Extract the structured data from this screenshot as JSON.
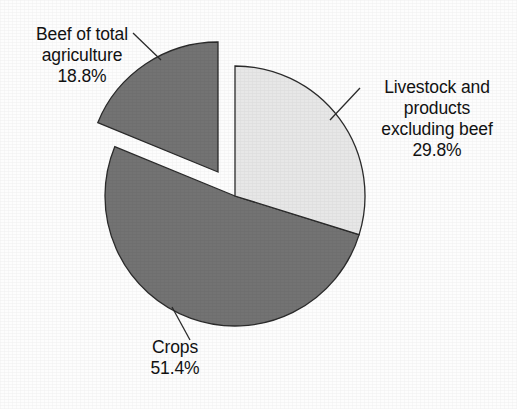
{
  "chart_data": {
    "type": "pie",
    "title": "",
    "categories": [
      "Beef of total agriculture",
      "Livestock and products excluding beef",
      "Crops"
    ],
    "values": [
      18.8,
      29.8,
      51.4
    ],
    "value_labels": [
      "18.8%",
      "29.8%",
      "51.4%"
    ],
    "units": "percent",
    "start_angle_deg": 0,
    "direction": "clockwise",
    "legend": "none",
    "grid": false,
    "slices": [
      {
        "name": "Beef of total agriculture",
        "value": 18.8,
        "label_lines": [
          "Beef of total",
          "agriculture",
          "18.8%"
        ],
        "color": "#737373",
        "exploded": true,
        "start_deg": 308.4,
        "end_deg": 360.0
      },
      {
        "name": "Livestock and products excluding beef",
        "value": 29.8,
        "label_lines": [
          "Livestock and",
          "products",
          "excluding beef",
          "29.8%"
        ],
        "color": "#e7e7e7",
        "exploded": false,
        "start_deg": 0.0,
        "end_deg": 107.3
      },
      {
        "name": "Crops",
        "value": 51.4,
        "label_lines": [
          "Crops",
          "51.4%"
        ],
        "color": "#737373",
        "exploded": false,
        "start_deg": 107.3,
        "end_deg": 308.4
      }
    ]
  },
  "labels": {
    "beef": {
      "line1": "Beef of total",
      "line2": "agriculture",
      "line3": "18.8%"
    },
    "livestock": {
      "line1": "Livestock and",
      "line2": "products",
      "line3": "excluding beef",
      "line4": "29.8%"
    },
    "crops": {
      "line1": "Crops",
      "line2": "51.4%"
    }
  },
  "colors": {
    "slice_dark": "#737373",
    "slice_light": "#e7e7e7",
    "outline": "#2b2b2b",
    "leader_line": "#2b2b2b",
    "background": "#fdfdfd",
    "text": "#121212"
  }
}
